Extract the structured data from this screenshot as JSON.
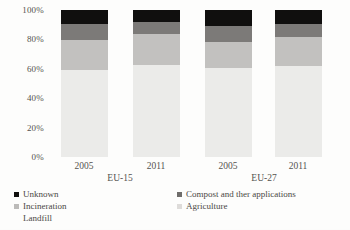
{
  "chart_data": {
    "type": "bar",
    "stacked": true,
    "stack_mode": "percent",
    "title": "",
    "xlabel": "",
    "ylabel": "",
    "ylim": [
      0,
      100
    ],
    "ytick_labels": [
      "100%",
      "80%",
      "60%",
      "40%",
      "20%",
      "0%"
    ],
    "ytick_values": [
      100,
      80,
      60,
      40,
      20,
      0
    ],
    "grid": false,
    "legend_position": "bottom",
    "categories": [
      "2005",
      "2011",
      "2005",
      "2011"
    ],
    "groups": [
      {
        "label": "EU-15",
        "categories": [
          "2005",
          "2011"
        ]
      },
      {
        "label": "EU-27",
        "categories": [
          "2005",
          "2011"
        ]
      }
    ],
    "series": [
      {
        "name": "Unknown",
        "color": "#100f0e",
        "values": [
          9.5,
          8.0,
          10.6,
          9.7
        ]
      },
      {
        "name": "Compost and ther applications",
        "color": "#7c7a78",
        "values": [
          11.0,
          8.5,
          11.0,
          9.0
        ]
      },
      {
        "name": "Incineration",
        "color": "#c2c1bf",
        "values": [
          20.0,
          21.0,
          18.0,
          19.7
        ]
      },
      {
        "name": "Landfill",
        "color": "#ebebe9",
        "values": [
          59.5,
          62.5,
          60.4,
          61.6
        ]
      },
      {
        "name": "Agriculture",
        "color": "#f6f6f4",
        "values": [
          0,
          0,
          0,
          0
        ]
      }
    ],
    "legend": {
      "left_column": [
        {
          "label": "Unknown",
          "marker": "legend-swatch",
          "color": "#100f0e",
          "has_marker": true
        },
        {
          "label": "Incineration",
          "marker": "legend-swatch",
          "color": "#bcbbb9",
          "has_marker": true
        },
        {
          "label": "Landfill",
          "marker": "legend-swatch",
          "color": "#f1f1ef",
          "has_marker": false
        }
      ],
      "right_column": [
        {
          "label": "Compost and ther applications",
          "marker": "legend-swatch",
          "color": "#6f6d6b",
          "has_marker": true
        },
        {
          "label": "Agriculture",
          "marker": "legend-swatch",
          "color": "#dedcda",
          "has_marker": true
        }
      ]
    }
  }
}
